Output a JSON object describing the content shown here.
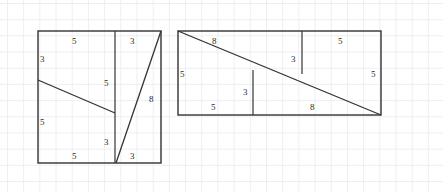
{
  "figure": {
    "stroke_color": "#333333",
    "grid_color": "#eceef2",
    "background_color": "#ffffff",
    "label_color": "#2b2b2b"
  },
  "left_figure": {
    "name": "square-arrangement",
    "outline": {
      "x": 38,
      "y": 31,
      "width": 123,
      "height": 132
    },
    "divider_x": 115,
    "shallow_diagonal": {
      "x1": 38,
      "y1": 80,
      "x2": 115,
      "y2": 113
    },
    "steep_diagonal": {
      "x1": 116,
      "y1": 163,
      "x2": 161,
      "y2": 31
    },
    "labels": [
      {
        "name": "label-top-left-5",
        "text": "5",
        "x": 72,
        "y": 37
      },
      {
        "name": "label-left-3",
        "text": "3",
        "x": 40,
        "y": 55
      },
      {
        "name": "label-left-5",
        "text": "5",
        "x": 40,
        "y": 118
      },
      {
        "name": "label-bottom-5",
        "text": "5",
        "x": 72,
        "y": 152
      },
      {
        "name": "label-inner-5",
        "text": "5",
        "x": 104,
        "y": 79
      },
      {
        "name": "label-inner-3",
        "text": "3",
        "x": 104,
        "y": 138
      },
      {
        "name": "label-top-right-3",
        "text": "3",
        "x": 130,
        "y": 37
      },
      {
        "name": "label-bottom-right-3",
        "text": "3",
        "x": 130,
        "y": 152
      },
      {
        "name": "label-right-8",
        "text": "8",
        "x": 149,
        "y": 95
      }
    ]
  },
  "right_figure": {
    "name": "rectangle-arrangement",
    "outline": {
      "x": 178,
      "y": 31,
      "width": 203,
      "height": 84
    },
    "diagonal": {
      "x1": 178,
      "y1": 31,
      "x2": 381,
      "y2": 115
    },
    "divider_short": {
      "x": 253,
      "y1": 70,
      "y2": 115
    },
    "divider_tall": {
      "x": 302,
      "y1": 31,
      "y2": 74
    },
    "labels": [
      {
        "name": "label-top-8",
        "text": "8",
        "x": 212,
        "y": 37
      },
      {
        "name": "label-top-5",
        "text": "5",
        "x": 338,
        "y": 37
      },
      {
        "name": "label-left-5",
        "text": "5",
        "x": 180,
        "y": 70
      },
      {
        "name": "label-right-5",
        "text": "5",
        "x": 371,
        "y": 70
      },
      {
        "name": "label-tall-divider-3",
        "text": "3",
        "x": 291,
        "y": 55
      },
      {
        "name": "label-short-divider-3",
        "text": "3",
        "x": 243,
        "y": 88
      },
      {
        "name": "label-bottom-5",
        "text": "5",
        "x": 211,
        "y": 103
      },
      {
        "name": "label-bottom-8",
        "text": "8",
        "x": 310,
        "y": 103
      }
    ]
  }
}
